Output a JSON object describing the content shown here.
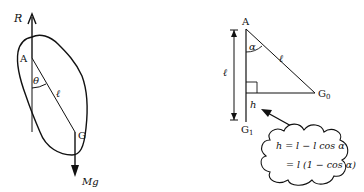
{
  "left_figure": {
    "labels": {
      "reaction": "R",
      "pivot": "A",
      "angle": "θ",
      "length": "ℓ",
      "center_of_mass": "G",
      "weight": "Mg"
    }
  },
  "right_figure": {
    "labels": {
      "pivot": "A",
      "angle": "α",
      "hypotenuse": "ℓ",
      "vertical_length": "ℓ",
      "g0": "G",
      "g0_sub": "0",
      "g1": "G",
      "g1_sub": "1",
      "height": "h"
    },
    "callout": {
      "line1": "h = l − l cos α",
      "line2": "= l (1 − cos α)"
    }
  },
  "colors": {
    "stroke": "#111111",
    "background": "#ffffff"
  }
}
